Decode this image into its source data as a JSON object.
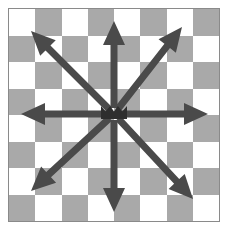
{
  "figure": {
    "width": 229,
    "height": 234
  },
  "board": {
    "name": "checkerboard",
    "columns": 8,
    "rows": 8,
    "first_cell_color": "light",
    "light_color": "#ffffff",
    "dark_color": "#a9a9a9",
    "border_color": "#8a8a8a",
    "background_color": "#ffffff",
    "left": 8,
    "top": 8,
    "width": 212,
    "height": 214
  },
  "arrows": {
    "color": "#4a4a4a",
    "count": 8,
    "origin": {
      "x": 105,
      "y": 105
    },
    "shaft_width": 7,
    "head_width": 22,
    "head_length": 24,
    "items": [
      {
        "name": "arrow-north",
        "label": "N",
        "angle_deg": 270,
        "tip": {
          "x": 105,
          "y": 12
        }
      },
      {
        "name": "arrow-northeast",
        "label": "NE",
        "angle_deg": 315,
        "tip": {
          "x": 173,
          "y": 18
        }
      },
      {
        "name": "arrow-east",
        "label": "E",
        "angle_deg": 0,
        "tip": {
          "x": 199,
          "y": 105
        }
      },
      {
        "name": "arrow-southeast",
        "label": "SE",
        "angle_deg": 45,
        "tip": {
          "x": 184,
          "y": 190
        }
      },
      {
        "name": "arrow-south",
        "label": "S",
        "angle_deg": 90,
        "tip": {
          "x": 105,
          "y": 203
        }
      },
      {
        "name": "arrow-southwest",
        "label": "SW",
        "angle_deg": 135,
        "tip": {
          "x": 22,
          "y": 182
        }
      },
      {
        "name": "arrow-west",
        "label": "W",
        "angle_deg": 180,
        "tip": {
          "x": 12,
          "y": 105
        }
      },
      {
        "name": "arrow-northwest",
        "label": "NW",
        "angle_deg": 225,
        "tip": {
          "x": 22,
          "y": 22
        }
      }
    ]
  },
  "center_marker": {
    "name": "center-piece-marker",
    "color": "#2e2e2e",
    "x": 105,
    "y": 103,
    "width": 26,
    "height": 16
  }
}
